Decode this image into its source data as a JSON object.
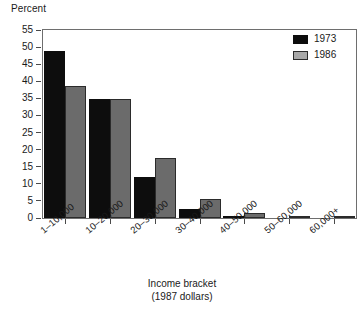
{
  "chart_data": {
    "type": "bar",
    "title": "",
    "subtitle": "",
    "xlabel": "Income bracket",
    "xlabel_line2": "(1987 dollars)",
    "ylabel": "Percent",
    "ylim": [
      0,
      55
    ],
    "ytick_step": 5,
    "grid": false,
    "legend_position": "top-right-inside",
    "categories": [
      "1–10,000",
      "10–20,000",
      "20–30,000",
      "30–40,000",
      "40–50,000",
      "50–60,000",
      "60,000+"
    ],
    "yticks": [
      "0",
      "5",
      "10",
      "15",
      "20",
      "25",
      "30",
      "35",
      "40",
      "45",
      "50",
      "55"
    ],
    "series": [
      {
        "name": "1973",
        "color": "#0d0d0d",
        "values": [
          49.0,
          34.7,
          12.0,
          2.5,
          0.3,
          0.0,
          0.0
        ]
      },
      {
        "name": "1986",
        "color": "#6b6b6b",
        "values": [
          38.5,
          34.7,
          17.6,
          5.6,
          1.6,
          0.7,
          0.3
        ]
      }
    ]
  },
  "legend": {
    "entries": [
      {
        "label": "1973",
        "swatch": "black-swatch"
      },
      {
        "label": "1986",
        "swatch": "gray-swatch"
      }
    ]
  },
  "axes": {
    "y_title": "Percent",
    "x_title_line1": "Income bracket",
    "x_title_line2": "(1987 dollars)"
  }
}
